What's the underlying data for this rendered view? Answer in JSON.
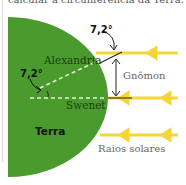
{
  "caption": "calcular a circunferência da Terra.",
  "diagram": {
    "earth_label": "Terra",
    "city_top": "Alexandria",
    "city_bottom": "Swenet",
    "gnomon_label": "Gnômon",
    "rays_label": "Raios solares",
    "angle_top": "7,2°",
    "angle_center": "7,2°"
  },
  "colors": {
    "earth": "#4a9a2e",
    "rays": "#f5d53a",
    "text_dark": "#1f3d12"
  }
}
